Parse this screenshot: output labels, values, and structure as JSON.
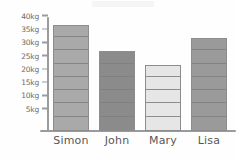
{
  "chart_data": {
    "type": "bar",
    "title": "",
    "subtitle": "",
    "xlabel": "",
    "ylabel": "",
    "categories": [
      "Simon",
      "John",
      "Mary",
      "Lisa"
    ],
    "values": [
      40,
      30,
      25,
      35
    ],
    "unit": "kg",
    "ylim": [
      0,
      42.5
    ],
    "ytick_values": [
      5,
      10,
      15,
      20,
      25,
      30,
      35,
      40
    ],
    "ytick_labels": [
      "5kg",
      "10kg",
      "15kg",
      "20kg",
      "25kg",
      "30kg",
      "35kg",
      "40kg"
    ],
    "grid": false,
    "legend": false,
    "legend_position": "none",
    "bar_segment_step": 5,
    "bars": [
      {
        "category": "Simon",
        "value": 40,
        "label": "40kg",
        "color": "#a9a9a9"
      },
      {
        "category": "John",
        "value": 30,
        "label": "30kg",
        "color": "#8b8b8b"
      },
      {
        "category": "Mary",
        "value": 25,
        "label": "25kg",
        "color": "#e6e6e6"
      },
      {
        "category": "Lisa",
        "value": 35,
        "label": "35kg",
        "color": "#9a9a9a"
      }
    ]
  },
  "style": {
    "background": "#fefefe",
    "axis_color": "#9b9b9b",
    "bar_outline": "#8d8d8d",
    "segment_line": "#7e7e7e",
    "ytick_text_color": "#6a6a6a",
    "xlabel_text_color": "#585858"
  }
}
